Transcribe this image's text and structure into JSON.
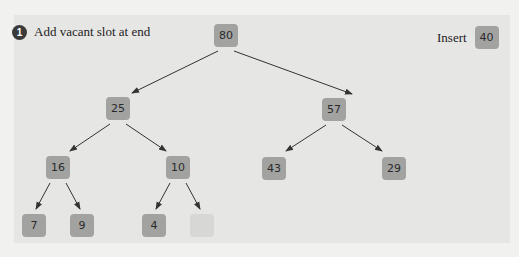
{
  "step": {
    "number": "1",
    "text": "Add vacant slot at end"
  },
  "insert": {
    "label": "Insert",
    "value": "40"
  },
  "nodes": {
    "n80": "80",
    "n25": "25",
    "n57": "57",
    "n16": "16",
    "n10": "10",
    "n43": "43",
    "n29": "29",
    "n7": "7",
    "n9": "9",
    "n4": "4",
    "vacant": ""
  },
  "colors": {
    "node": "#a2a2a1",
    "vacant": "#d7d7d6",
    "panel": "#e6e6e5",
    "edge": "#333333"
  }
}
